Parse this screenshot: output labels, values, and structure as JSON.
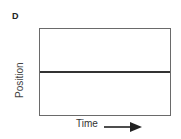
{
  "panel_label": "D",
  "chart_data": {
    "type": "line",
    "title": "",
    "panel": "D",
    "xlabel": "Time",
    "ylabel": "Position",
    "x_axis_arrow": true,
    "grid": false,
    "legend": null,
    "series": [
      {
        "name": "position",
        "x": [
          0,
          1
        ],
        "y": [
          0.5,
          0.5
        ],
        "description": "constant position (horizontal line) at mid-height"
      }
    ],
    "xlim": [
      0,
      1
    ],
    "ylim": [
      0,
      1
    ],
    "tick_labels": false
  },
  "line_position_fraction": 0.5
}
